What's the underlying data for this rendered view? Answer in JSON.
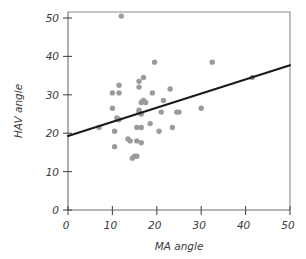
{
  "chart_data": {
    "type": "scatter",
    "title": "",
    "xlabel": "MA angle",
    "ylabel": "HAV angle",
    "xlim": [
      0,
      50
    ],
    "ylim": [
      0,
      50
    ],
    "xticks": [
      0,
      10,
      20,
      30,
      40,
      50
    ],
    "yticks": [
      0,
      10,
      20,
      30,
      40,
      50
    ],
    "xticklabels": [
      "0",
      "10",
      "20",
      "30",
      "40",
      "50"
    ],
    "yticklabels": [
      "0",
      "10",
      "20",
      "30",
      "40",
      "50"
    ],
    "grid": false,
    "legend": null,
    "point_color": "#9b9b9b",
    "line_color": "#1a1a1a",
    "axis_color": "#6d6d6d",
    "points": [
      {
        "x": 12.0,
        "y": 50.5
      },
      {
        "x": 19.5,
        "y": 38.5
      },
      {
        "x": 32.5,
        "y": 38.5
      },
      {
        "x": 17.0,
        "y": 34.5
      },
      {
        "x": 16.0,
        "y": 33.5
      },
      {
        "x": 11.5,
        "y": 32.5
      },
      {
        "x": 16.0,
        "y": 32.0
      },
      {
        "x": 23.0,
        "y": 31.5
      },
      {
        "x": 11.5,
        "y": 30.5
      },
      {
        "x": 10.0,
        "y": 30.5
      },
      {
        "x": 19.0,
        "y": 30.5
      },
      {
        "x": 17.0,
        "y": 28.5
      },
      {
        "x": 21.5,
        "y": 28.5
      },
      {
        "x": 16.5,
        "y": 28.0
      },
      {
        "x": 17.5,
        "y": 28.0
      },
      {
        "x": 16.0,
        "y": 26.0
      },
      {
        "x": 10.0,
        "y": 26.5
      },
      {
        "x": 30.0,
        "y": 26.5
      },
      {
        "x": 21.0,
        "y": 25.5
      },
      {
        "x": 25.0,
        "y": 25.5
      },
      {
        "x": 24.5,
        "y": 25.5
      },
      {
        "x": 16.0,
        "y": 25.5
      },
      {
        "x": 16.5,
        "y": 25.0
      },
      {
        "x": 11.0,
        "y": 24.0
      },
      {
        "x": 11.5,
        "y": 23.5
      },
      {
        "x": 18.5,
        "y": 22.5
      },
      {
        "x": 7.0,
        "y": 21.5
      },
      {
        "x": 23.5,
        "y": 21.5
      },
      {
        "x": 15.5,
        "y": 21.5
      },
      {
        "x": 16.5,
        "y": 21.5
      },
      {
        "x": 10.5,
        "y": 20.5
      },
      {
        "x": 20.5,
        "y": 20.5
      },
      {
        "x": 13.5,
        "y": 18.5
      },
      {
        "x": 14.0,
        "y": 18.0
      },
      {
        "x": 15.5,
        "y": 18.0
      },
      {
        "x": 16.5,
        "y": 17.5
      },
      {
        "x": 10.5,
        "y": 16.5
      },
      {
        "x": 15.0,
        "y": 14.0
      },
      {
        "x": 15.5,
        "y": 14.0
      },
      {
        "x": 14.5,
        "y": 13.5
      },
      {
        "x": 41.5,
        "y": 34.5
      }
    ],
    "fit_line": {
      "x0": 0.0,
      "y0": 19.3,
      "x1": 50.0,
      "y1": 37.7
    }
  }
}
